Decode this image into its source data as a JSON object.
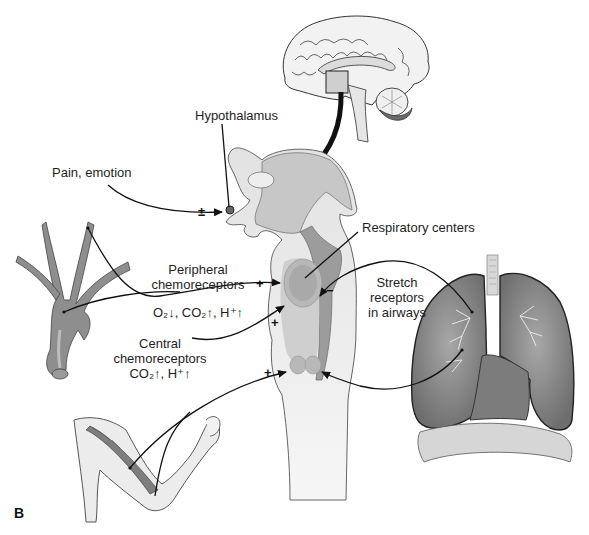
{
  "figure": {
    "panel_label": "B"
  },
  "labels": {
    "hypothalamus": "Hypothalamus",
    "pain_emotion": "Pain, emotion",
    "respiratory_centers": "Respiratory centers",
    "peripheral_line1": "Peripheral",
    "peripheral_line2": "chemoreceptors",
    "peripheral_stimuli": "O₂↓, CO₂↑, H⁺↑",
    "central_line1": "Central",
    "central_line2": "chemoreceptors",
    "central_stimuli": "CO₂↑, H⁺↑",
    "stretch_line1": "Stretch",
    "stretch_line2": "receptors",
    "stretch_line3": "in airways"
  },
  "signs": {
    "pain_emotion": "±",
    "peripheral": "+",
    "central": "+",
    "muscle": "+",
    "stretch": "−"
  },
  "colors": {
    "background": "#ffffff",
    "brainstem_light": "#e4e4e4",
    "brainstem_mid": "#c4c4c4",
    "brainstem_dark": "#9a9a9a",
    "vessel": "#8e8e8e",
    "lung": "#8a8a8a",
    "arrow": "#111111"
  }
}
